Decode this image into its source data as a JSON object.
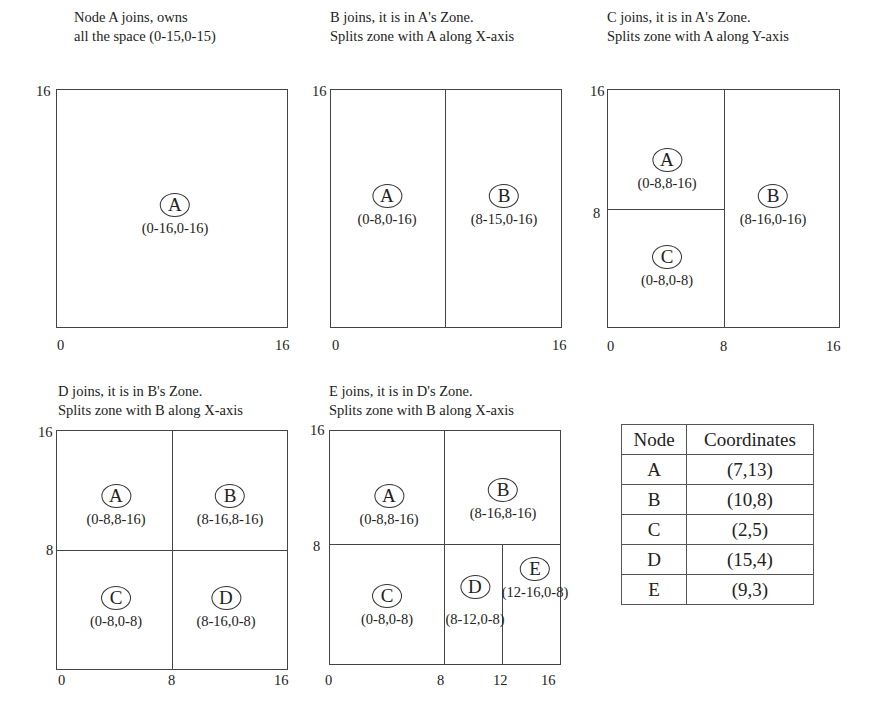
{
  "panels": [
    {
      "title_lines": [
        "Node A joins, owns",
        "all the space (0-15,0-15)"
      ],
      "axis": {
        "y_top": "16",
        "x_left": "0",
        "x_right": "16"
      },
      "zones": [
        {
          "node": "A",
          "range": "(0-16,0-16)"
        }
      ]
    },
    {
      "title_lines": [
        "B joins, it is in A's Zone.",
        "Splits zone with A along X-axis"
      ],
      "axis": {
        "y_top": "16",
        "x_left": "0",
        "x_right": "16"
      },
      "zones": [
        {
          "node": "A",
          "range": "(0-8,0-16)"
        },
        {
          "node": "B",
          "range": "(8-15,0-16)"
        }
      ]
    },
    {
      "title_lines": [
        "C joins, it is in A's Zone.",
        "Splits zone with A along Y-axis"
      ],
      "axis": {
        "y_top": "16",
        "y_mid": "8",
        "x_left": "0",
        "x_mid": "8",
        "x_right": "16"
      },
      "zones": [
        {
          "node": "A",
          "range": "(0-8,8-16)"
        },
        {
          "node": "B",
          "range": "(8-16,0-16)"
        },
        {
          "node": "C",
          "range": "(0-8,0-8)"
        }
      ]
    },
    {
      "title_lines": [
        "D joins, it is in B's Zone.",
        "Splits zone with B along X-axis"
      ],
      "axis": {
        "y_top": "16",
        "y_mid": "8",
        "x_left": "0",
        "x_mid": "8",
        "x_right": "16"
      },
      "zones": [
        {
          "node": "A",
          "range": "(0-8,8-16)"
        },
        {
          "node": "B",
          "range": "(8-16,8-16)"
        },
        {
          "node": "C",
          "range": "(0-8,0-8)"
        },
        {
          "node": "D",
          "range": "(8-16,0-8)"
        }
      ]
    },
    {
      "title_lines": [
        "E joins, it is in D's Zone.",
        "Splits zone with B along X-axis"
      ],
      "axis": {
        "y_top": "16",
        "y_mid": "8",
        "x_left": "0",
        "x_mid": "8",
        "x_q3": "12",
        "x_right": "16"
      },
      "zones": [
        {
          "node": "A",
          "range": "(0-8,8-16)"
        },
        {
          "node": "B",
          "range": "(8-16,8-16)"
        },
        {
          "node": "C",
          "range": "(0-8,0-8)"
        },
        {
          "node": "D",
          "range": "(8-12,0-8)"
        },
        {
          "node": "E",
          "range": "(12-16,0-8)"
        }
      ]
    }
  ],
  "table": {
    "headers": [
      "Node",
      "Coordinates"
    ],
    "rows": [
      {
        "node": "A",
        "coords": "(7,13)"
      },
      {
        "node": "B",
        "coords": "(10,8)"
      },
      {
        "node": "C",
        "coords": "(2,5)"
      },
      {
        "node": "D",
        "coords": "(15,4)"
      },
      {
        "node": "E",
        "coords": "(9,3)"
      }
    ]
  },
  "colors": {
    "line": "#444444",
    "text": "#222222",
    "background": "#ffffff"
  }
}
